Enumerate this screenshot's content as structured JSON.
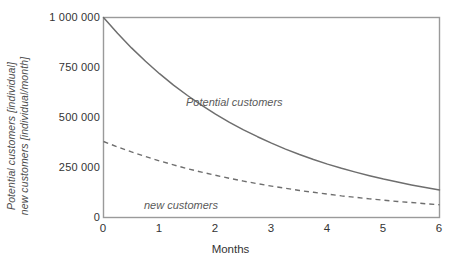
{
  "chart_data": {
    "type": "line",
    "title": "",
    "xlabel": "Months",
    "ylabel_line1": "Potential customers [individual]",
    "ylabel_line2": "new customers [individual/month]",
    "xlim": [
      0,
      6
    ],
    "ylim": [
      0,
      1000000
    ],
    "grid": false,
    "legend_position": "inline-annotation",
    "xticks": [
      "0",
      "1",
      "2",
      "3",
      "4",
      "5",
      "6"
    ],
    "xtick_values": [
      0,
      1,
      2,
      3,
      4,
      5,
      6
    ],
    "yticks": [
      "0",
      "250 000",
      "500 000",
      "750 000",
      "1 000 000"
    ],
    "ytick_values": [
      0,
      250000,
      500000,
      750000,
      1000000
    ],
    "x": [
      0,
      0.25,
      0.5,
      0.75,
      1,
      1.25,
      1.5,
      1.75,
      2,
      2.25,
      2.5,
      2.75,
      3,
      3.25,
      3.5,
      3.75,
      4,
      4.25,
      4.5,
      4.75,
      5,
      5.25,
      5.5,
      5.75,
      6
    ],
    "series": [
      {
        "name": "Potential customers",
        "style": "solid",
        "color": "#6e6e6e",
        "annotation": "Potential customers",
        "values": [
          1000000,
          921000,
          848000,
          781000,
          719000,
          662000,
          610000,
          562000,
          517000,
          476000,
          438000,
          404000,
          372000,
          342000,
          315000,
          290000,
          267000,
          246000,
          227000,
          209000,
          192000,
          177000,
          163000,
          150000,
          138000
        ]
      },
      {
        "name": "new customers",
        "style": "dashed",
        "color": "#6e6e6e",
        "annotation": "new customers",
        "values": [
          380000,
          353000,
          328000,
          305000,
          283000,
          263000,
          244000,
          227000,
          211000,
          196000,
          182000,
          169000,
          157000,
          146000,
          135000,
          126000,
          117000,
          108000,
          101000,
          93000,
          87000,
          80000,
          75000,
          69000,
          64000
        ]
      }
    ]
  },
  "annotations": {
    "potential_label": "Potential customers",
    "new_label": "new customers"
  },
  "axis": {
    "x_title": "Months",
    "y_title_line1": "Potential customers [individual]",
    "y_title_line2": "new customers [individual/month]"
  },
  "colors": {
    "frame": "#9a9a9a",
    "series": "#6e6e6e",
    "text": "#333333",
    "annotation_text": "#5a5a5a",
    "background": "#ffffff"
  }
}
